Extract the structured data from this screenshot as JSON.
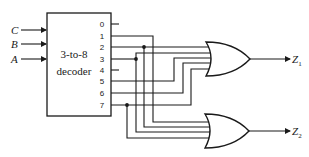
{
  "diagram": {
    "type": "logic-circuit",
    "decoder": {
      "line1": "3-to-8",
      "line2": "decoder",
      "inputs": [
        "C",
        "B",
        "A"
      ],
      "outputs": [
        "0",
        "1",
        "2",
        "3",
        "4",
        "5",
        "6",
        "7"
      ]
    },
    "gates": [
      {
        "id": "gate-z1",
        "type": "OR",
        "inputs_from": [
          "2",
          "3",
          "5",
          "6",
          "7"
        ],
        "output": "Z",
        "output_sub": "1"
      },
      {
        "id": "gate-z2",
        "type": "OR",
        "inputs_from": [
          "1",
          "2",
          "3",
          "7"
        ],
        "output": "Z",
        "output_sub": "2"
      }
    ],
    "unconnected_outputs": [
      "0",
      "4"
    ]
  }
}
